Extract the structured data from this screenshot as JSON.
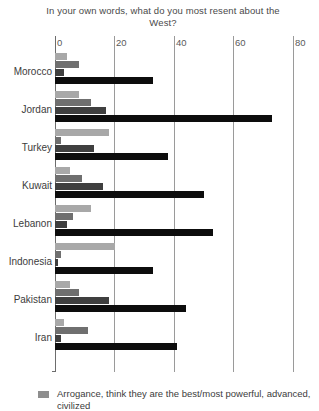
{
  "chart_data": {
    "type": "bar",
    "orientation": "horizontal",
    "grouped": true,
    "title": "In your own words, what do you most resent about the West?",
    "xlabel": "",
    "ylabel": "",
    "xlim": [
      0,
      80
    ],
    "xticks": [
      0,
      20,
      40,
      60,
      80
    ],
    "xtick_labels": [
      "0",
      "20",
      "40",
      "60",
      "80"
    ],
    "grid": true,
    "grid_axis": "x",
    "legend_position": "bottom",
    "categories": [
      "Morocco",
      "Jordan",
      "Turkey",
      "Kuwait",
      "Lebanon",
      "Indonesia",
      "Pakistan",
      "Iran"
    ],
    "series": [
      {
        "name": "series-1",
        "shade": "#a8a8a8",
        "values": [
          4,
          8,
          18,
          5,
          12,
          20,
          5,
          3
        ]
      },
      {
        "name": "series-2",
        "shade": "#6f6f6f",
        "values": [
          8,
          12,
          2,
          9,
          6,
          2,
          8,
          11
        ]
      },
      {
        "name": "series-3",
        "shade": "#3f3f3f",
        "values": [
          3,
          17,
          13,
          16,
          4,
          1,
          18,
          2
        ]
      },
      {
        "name": "series-4",
        "shade": "#0d0d0d",
        "values": [
          33,
          73,
          38,
          50,
          53,
          33,
          44,
          41
        ]
      }
    ],
    "legend": [
      {
        "swatch": "#8e8e8e",
        "label": "Arrogance, think they are the best/most powerful, advanced, civilized",
        "clipped": true
      }
    ]
  },
  "axis": {
    "ticks": [
      {
        "label": "0",
        "value": 0
      },
      {
        "label": "20",
        "value": 20
      },
      {
        "label": "40",
        "value": 40
      },
      {
        "label": "60",
        "value": 60
      },
      {
        "label": "80",
        "value": 80
      }
    ]
  }
}
